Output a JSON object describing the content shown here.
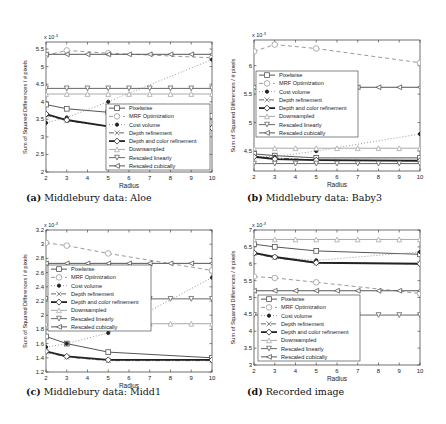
{
  "chart_data": [
    {
      "type": "line",
      "panel": "a",
      "caption_label": "(a)",
      "caption_text": "Middlebury data: Aloe",
      "xlabel": "Radius",
      "ylabel": "Sum of Squared Differences / # pixels",
      "y_multiplier": "x 10^-3",
      "xlim": [
        2,
        10
      ],
      "ylim": [
        2,
        5.7
      ],
      "xticks": [
        2,
        3,
        4,
        5,
        6,
        7,
        8,
        9,
        10
      ],
      "yticks": [
        2,
        2.5,
        3,
        3.5,
        4,
        4.5,
        5,
        5.5
      ],
      "grid": false,
      "legend_position": "lower right",
      "x": [
        2,
        3,
        5,
        10
      ],
      "series": [
        {
          "name": "Pixelwise",
          "values": [
            3.92,
            3.8,
            3.7,
            3.6
          ]
        },
        {
          "name": "MRF Optimization",
          "values": [
            5.32,
            5.46,
            5.38,
            5.25
          ]
        },
        {
          "name": "Cost volume",
          "values": [
            3.4,
            3.55,
            4.0,
            5.2
          ]
        },
        {
          "name": "Depth refinement",
          "values": [
            3.62,
            3.46,
            3.3,
            3.26
          ]
        },
        {
          "name": "Depth and color refinement",
          "values": [
            3.65,
            3.48,
            3.3,
            3.25
          ]
        },
        {
          "name": "Downsampled",
          "values": [
            4.22,
            4.22,
            4.22,
            4.22
          ]
        },
        {
          "name": "Rescaled linearly",
          "values": [
            4.38,
            4.38,
            4.38,
            4.38
          ]
        },
        {
          "name": "Rescaled cubically",
          "values": [
            5.35,
            5.35,
            5.35,
            5.35
          ]
        }
      ]
    },
    {
      "type": "line",
      "panel": "b",
      "caption_label": "(b)",
      "caption_text": "Middlebury data: Baby3",
      "xlabel": "Radius",
      "ylabel": "Sum of Squared Differences / # pixels",
      "y_multiplier": "x 10^-3",
      "xlim": [
        2,
        10
      ],
      "ylim": [
        4.15,
        6.45
      ],
      "xticks": [
        2,
        3,
        4,
        5,
        6,
        7,
        8,
        9,
        10
      ],
      "yticks": [
        4.5,
        5,
        5.5,
        6
      ],
      "grid": false,
      "legend_position": "upper left",
      "x": [
        2,
        3,
        5,
        10
      ],
      "series": [
        {
          "name": "Pixelwise",
          "values": [
            4.45,
            4.42,
            4.38,
            4.38
          ]
        },
        {
          "name": "MRF Optimization",
          "values": [
            6.25,
            6.37,
            6.3,
            6.05
          ]
        },
        {
          "name": "Cost volume",
          "values": [
            4.4,
            4.4,
            4.5,
            4.8
          ]
        },
        {
          "name": "Depth refinement",
          "values": [
            4.4,
            4.38,
            4.34,
            4.33
          ]
        },
        {
          "name": "Depth and color refinement",
          "values": [
            4.4,
            4.36,
            4.34,
            4.33
          ]
        },
        {
          "name": "Downsampled",
          "values": [
            4.55,
            4.55,
            4.55,
            4.55
          ]
        },
        {
          "name": "Rescaled linearly",
          "values": [
            4.28,
            4.28,
            4.28,
            4.28
          ]
        },
        {
          "name": "Rescaled cubically",
          "values": [
            5.62,
            5.62,
            5.62,
            5.62
          ]
        }
      ]
    },
    {
      "type": "line",
      "panel": "c",
      "caption_label": "(c)",
      "caption_text": "Middlebury data: Midd1",
      "xlabel": "Radius",
      "ylabel": "Sum of Squared Differences / # pixels",
      "y_multiplier": "x 10^-3",
      "xlim": [
        2,
        10
      ],
      "ylim": [
        1.2,
        3.2
      ],
      "xticks": [
        2,
        3,
        4,
        5,
        6,
        7,
        8,
        9,
        10
      ],
      "yticks": [
        1.2,
        1.4,
        1.6,
        1.8,
        2,
        2.2,
        2.4,
        2.6,
        2.8,
        3,
        3.2
      ],
      "grid": false,
      "legend_position": "upper left",
      "x": [
        2,
        3,
        5,
        10
      ],
      "series": [
        {
          "name": "Pixelwise",
          "values": [
            1.7,
            1.6,
            1.48,
            1.4
          ]
        },
        {
          "name": "MRF Optimization",
          "values": [
            3.02,
            2.98,
            2.87,
            2.63
          ]
        },
        {
          "name": "Cost volume",
          "values": [
            1.55,
            1.6,
            1.75,
            2.53
          ]
        },
        {
          "name": "Depth refinement",
          "values": [
            1.48,
            1.41,
            1.36,
            1.36
          ]
        },
        {
          "name": "Depth and color refinement",
          "values": [
            1.49,
            1.42,
            1.37,
            1.37
          ]
        },
        {
          "name": "Downsampled",
          "values": [
            1.88,
            1.88,
            1.88,
            1.88
          ]
        },
        {
          "name": "Rescaled linearly",
          "values": [
            2.23,
            2.23,
            2.23,
            2.23
          ]
        },
        {
          "name": "Rescaled cubically",
          "values": [
            2.73,
            2.73,
            2.73,
            2.73
          ]
        }
      ]
    },
    {
      "type": "line",
      "panel": "d",
      "caption_label": "(d)",
      "caption_text": "Recorded image",
      "xlabel": "Radius",
      "ylabel": "Sum of Squared Differences / # pixels",
      "y_multiplier": "x 10^-3",
      "xlim": [
        2,
        10
      ],
      "ylim": [
        3,
        7
      ],
      "xticks": [
        2,
        3,
        4,
        5,
        6,
        7,
        8,
        9,
        10
      ],
      "yticks": [
        3,
        3.5,
        4,
        4.5,
        5,
        5.5,
        6,
        6.5,
        7
      ],
      "grid": false,
      "legend_position": "lower left",
      "x": [
        2,
        3,
        5,
        10
      ],
      "series": [
        {
          "name": "Pixelwise",
          "values": [
            6.58,
            6.5,
            6.38,
            6.28
          ]
        },
        {
          "name": "MRF Optimization",
          "values": [
            5.62,
            5.58,
            5.45,
            5.12
          ]
        },
        {
          "name": "Cost volume",
          "values": [
            6.3,
            6.2,
            6.1,
            6.35
          ]
        },
        {
          "name": "Depth refinement",
          "values": [
            6.3,
            6.18,
            6.02,
            6.0
          ]
        },
        {
          "name": "Depth and color refinement",
          "values": [
            6.32,
            6.2,
            6.03,
            6.0
          ]
        },
        {
          "name": "Downsampled",
          "values": [
            6.72,
            6.72,
            6.72,
            6.72
          ]
        },
        {
          "name": "Rescaled linearly",
          "values": [
            4.48,
            4.48,
            4.48,
            4.48
          ]
        },
        {
          "name": "Rescaled cubically",
          "values": [
            5.2,
            5.2,
            5.2,
            5.2
          ]
        }
      ]
    }
  ],
  "styles": {
    "Pixelwise": {
      "color": "#555555",
      "dash": "",
      "marker": "square",
      "width": 1
    },
    "MRF Optimization": {
      "color": "#9a9a9a",
      "dash": "4,3",
      "marker": "circle",
      "width": 1
    },
    "Cost volume": {
      "color": "#9a9a9a",
      "dash": "1,2",
      "marker": "star",
      "width": 1
    },
    "Depth refinement": {
      "color": "#666666",
      "dash": "5,2,1,2",
      "marker": "x",
      "width": 1
    },
    "Depth and color refinement": {
      "color": "#222222",
      "dash": "",
      "marker": "diamond",
      "width": 1.8
    },
    "Downsampled": {
      "color": "#aaaaaa",
      "dash": "",
      "marker": "triangle-up",
      "width": 1
    },
    "Rescaled linearly": {
      "color": "#666666",
      "dash": "",
      "marker": "triangle-down",
      "width": 1
    },
    "Rescaled cubically": {
      "color": "#555555",
      "dash": "",
      "marker": "triangle-left",
      "width": 1
    }
  }
}
